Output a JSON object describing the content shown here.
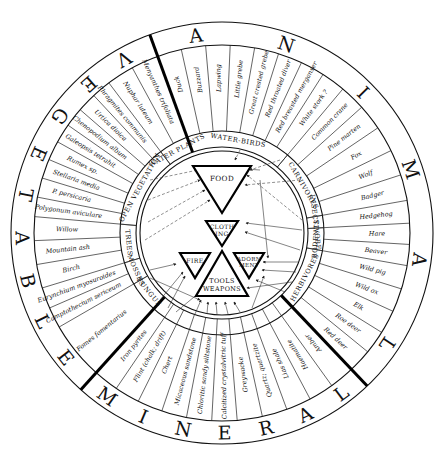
{
  "kingdoms": [
    {
      "name": "VEGETABLE",
      "start_deg": 132,
      "end_deg": 250
    },
    {
      "name": "ANIMAL",
      "start_deg": -110,
      "end_deg": 46.5
    },
    {
      "name": "MINERAL",
      "start_deg": 46.5,
      "end_deg": 132
    }
  ],
  "categories": [
    {
      "label": "WATER-BIRDS",
      "start_deg": -110,
      "end_deg": -50
    },
    {
      "label": "CARNIVORES",
      "start_deg": -50,
      "end_deg": -10
    },
    {
      "label": "INSECTIVORE",
      "start_deg": -10,
      "end_deg": -3
    },
    {
      "label": "RODENTS",
      "start_deg": -3,
      "end_deg": 10
    },
    {
      "label": "HERBIVORES",
      "start_deg": 10,
      "end_deg": 46.5
    },
    {
      "label": "FUNGUS",
      "start_deg": 132,
      "end_deg": 150
    },
    {
      "label": "MOSSES",
      "start_deg": 150,
      "end_deg": 163
    },
    {
      "label": "TREES",
      "start_deg": 163,
      "end_deg": 185
    },
    {
      "label": "OPEN VEGETATION",
      "start_deg": 185,
      "end_deg": 233
    },
    {
      "label": "WATER PLANTS",
      "start_deg": 233,
      "end_deg": 250
    }
  ],
  "items": {
    "water_birds": [
      "Duck",
      "Buzzard",
      "Lapwing",
      "Little grebe",
      "Great crested grebe",
      "Red throated diver",
      "Red breasted merganser",
      "White stork ?"
    ],
    "carnivores": [
      "Common crane",
      "Pine marten",
      "Fox",
      "Wolf",
      "Badger"
    ],
    "insectivore": [
      "Hedgehog"
    ],
    "rodents": [
      "Hare",
      "Beaver"
    ],
    "herbivores": [
      "Wild pig",
      "Wild ox",
      "Elk",
      "Roe deer",
      "Red deer"
    ],
    "minerals": [
      "Amber",
      "Haematite",
      "Lias shale",
      "Quartz; quartzite",
      "Greywacke",
      "Calcitized crystalvitric tuff",
      "Chloritic sandy siltstone",
      "Micaceous sandstone",
      "Chert",
      "Flint (chalk; drift)",
      "Iron pyrites"
    ],
    "fungus": [
      "Fomes fomentarius"
    ],
    "mosses": [
      "Camptothecium sericeum",
      "Eurynchium myosuroides"
    ],
    "trees": [
      "Birch",
      "Mountain ash",
      "Willow"
    ],
    "open_vegetation": [
      "Polygonum aviculare",
      "P. persicaria",
      "Stellaria media",
      "Rumex sp.",
      "Galeopsis tetrahit",
      "Chenopodium album",
      "Urtica dioica",
      "Phragmites communis"
    ],
    "water_plants": [
      "Nuphar luteum",
      "Menyanthes trifoliata"
    ]
  },
  "uses": {
    "food": "FOOD",
    "clothing_1": "CLOTH",
    "clothing_2": "ING",
    "fire": "FIRE",
    "adornment_1": "ADORN",
    "adornment_2": "MENT",
    "tools_1": "TOOLS",
    "tools_2": "WEAPONS"
  },
  "colors": {
    "ink": "#111111",
    "paper": "#ffffff"
  }
}
